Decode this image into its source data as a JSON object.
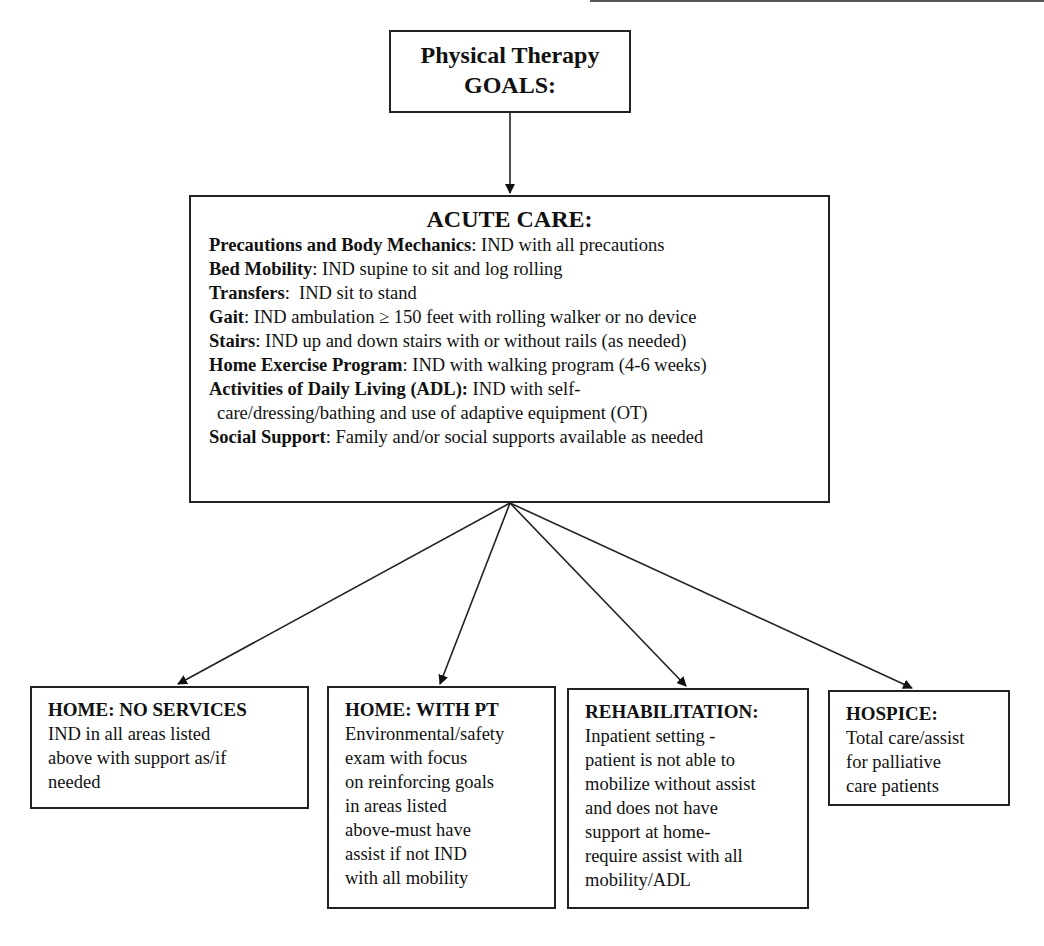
{
  "title_box": {
    "line1": "Physical Therapy",
    "line2": "GOALS:"
  },
  "acute_care": {
    "heading": "ACUTE CARE:",
    "goals": [
      {
        "label": "Precautions and Body Mechanics",
        "sep": ":",
        "text": " IND with all precautions"
      },
      {
        "label": "Bed Mobility",
        "sep": ":",
        "text": " IND supine to sit and log rolling"
      },
      {
        "label": "Transfers",
        "sep": ":",
        "text": "  IND sit to stand"
      },
      {
        "label": "Gait",
        "sep": ":",
        "text": " IND ambulation ≥ 150 feet with rolling walker or no device"
      },
      {
        "label": "Stairs",
        "sep": ":",
        "text": " IND up and down stairs with or without rails (as needed)"
      },
      {
        "label": "Home Exercise Program",
        "sep": ":",
        "text": " IND with walking program (4-6 weeks)"
      },
      {
        "label": "Activities of Daily Living (ADL):",
        "sep": "",
        "text": " IND with self-"
      },
      {
        "label": "",
        "sep": "",
        "text": "care/dressing/bathing and use of adaptive equipment (OT)"
      },
      {
        "label": "Social Support",
        "sep": ":",
        "text": " Family and/or social supports available as needed"
      }
    ]
  },
  "outcomes": [
    {
      "heading": "HOME: NO SERVICES",
      "body": "IND in all areas listed\nabove with support as/if\nneeded"
    },
    {
      "heading": "HOME: WITH PT",
      "body": "Environmental/safety\nexam with focus\non reinforcing goals\nin areas listed\nabove-must have\nassist if not IND\nwith all mobility"
    },
    {
      "heading": "REHABILITATION:",
      "body": "Inpatient setting -\npatient is not able to\nmobilize without assist\nand does not have\nsupport at home-\nrequire assist with all\nmobility/ADL"
    },
    {
      "heading": "HOSPICE:",
      "body": "Total care/assist\nfor palliative\ncare patients"
    }
  ],
  "colors": {
    "line": "#222222",
    "background": "#ffffff"
  }
}
